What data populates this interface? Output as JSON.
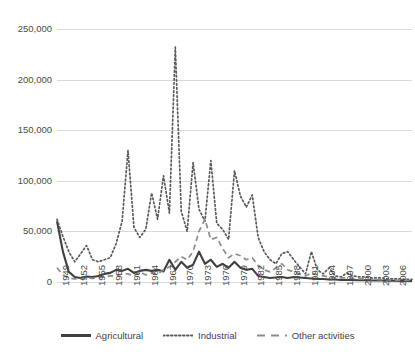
{
  "chart_data": {
    "type": "line",
    "title": "",
    "xlabel": "",
    "ylabel": "",
    "xlim": [
      1949,
      2009
    ],
    "ylim": [
      0,
      250000
    ],
    "ytick_labels": [
      "250,000",
      "200,000",
      "150,000",
      "100,000",
      "50,000",
      "0"
    ],
    "ytick_values": [
      250000,
      200000,
      150000,
      100000,
      50000,
      0
    ],
    "grid": "horizontal",
    "legend_position": "bottom",
    "xtick_labels": [
      "1949",
      "1952",
      "1955",
      "1958",
      "1961",
      "1964",
      "1967",
      "1970",
      "1973",
      "1976",
      "1979",
      "1982",
      "1985",
      "1988",
      "1991",
      "1994",
      "1997",
      "2000",
      "2003",
      "2006",
      "2009"
    ],
    "xtick_values": [
      1949,
      1952,
      1955,
      1958,
      1961,
      1964,
      1967,
      1970,
      1973,
      1976,
      1979,
      1982,
      1985,
      1988,
      1991,
      1994,
      1997,
      2000,
      2003,
      2006,
      2009
    ],
    "x": [
      1949,
      1950,
      1951,
      1952,
      1953,
      1954,
      1955,
      1956,
      1957,
      1958,
      1959,
      1960,
      1961,
      1962,
      1963,
      1964,
      1965,
      1966,
      1967,
      1968,
      1969,
      1970,
      1971,
      1972,
      1973,
      1974,
      1975,
      1976,
      1977,
      1978,
      1979,
      1980,
      1981,
      1982,
      1983,
      1984,
      1985,
      1986,
      1987,
      1988,
      1989,
      1990,
      1991,
      1992,
      1993,
      1994,
      1995,
      1996,
      1997,
      1998,
      1999,
      2000,
      2001,
      2002,
      2003,
      2004,
      2005,
      2006,
      2007,
      2008,
      2009
    ],
    "series": [
      {
        "name": "Agricultural",
        "style": "solid",
        "color": "#404040",
        "values": [
          60000,
          30000,
          10000,
          5000,
          4000,
          5500,
          5000,
          6000,
          8000,
          9000,
          12000,
          11000,
          13000,
          9000,
          11000,
          12000,
          11000,
          12000,
          10500,
          22000,
          12000,
          20000,
          14000,
          17000,
          30000,
          18000,
          22000,
          15000,
          18000,
          14000,
          20000,
          14000,
          12000,
          13000,
          6000,
          5000,
          4000,
          4500,
          5000,
          4000,
          5000,
          4500,
          4000,
          3500,
          3000,
          3000,
          2500,
          2500,
          2000,
          2000,
          2000,
          1800,
          1800,
          1500,
          1500,
          1500,
          1200,
          1200,
          1000,
          1000,
          1000
        ]
      },
      {
        "name": "Industrial",
        "style": "dotted",
        "color": "#595959",
        "values": [
          62000,
          45000,
          30000,
          20000,
          28000,
          36000,
          22000,
          20000,
          22000,
          24000,
          38000,
          60000,
          130000,
          54000,
          44000,
          52000,
          88000,
          62000,
          105000,
          68000,
          232000,
          70000,
          50000,
          118000,
          72000,
          60000,
          120000,
          58000,
          52000,
          42000,
          110000,
          85000,
          74000,
          86000,
          44000,
          30000,
          22000,
          18000,
          28000,
          30000,
          22000,
          15000,
          8000,
          30000,
          12000,
          8000,
          14000,
          6000,
          5000,
          9000,
          6000,
          5000,
          5000,
          4000,
          4000,
          4000,
          3000,
          3000,
          3000,
          2500,
          2500
        ]
      },
      {
        "name": "Other activities",
        "style": "dashed",
        "color": "#8c8c8c",
        "values": [
          14000,
          7000,
          4000,
          3000,
          3000,
          4000,
          3500,
          4000,
          5000,
          6000,
          6000,
          8000,
          8000,
          6000,
          10000,
          7000,
          9000,
          8000,
          12000,
          15000,
          20000,
          25000,
          22000,
          30000,
          50000,
          62000,
          42000,
          44000,
          33000,
          24000,
          28000,
          26000,
          22000,
          24000,
          16000,
          12000,
          10000,
          14000,
          18000,
          12000,
          10000,
          8000,
          6000,
          9000,
          7000,
          6000,
          5000,
          4000,
          4000,
          4000,
          3500,
          3000,
          3000,
          2500,
          2500,
          2000,
          2000,
          2000,
          1500,
          1500,
          1500
        ]
      }
    ]
  },
  "legend": {
    "items": [
      {
        "label": "Agricultural"
      },
      {
        "label": "Industrial"
      },
      {
        "label": "Other activities"
      }
    ]
  }
}
